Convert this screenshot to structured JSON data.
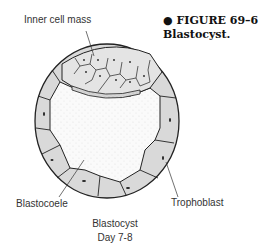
{
  "figure": {
    "bullet_icon": "filled-circle",
    "number": "FIGURE 69–6",
    "caption": "Blastocyst."
  },
  "labels": {
    "inner_cell_mass": "Inner cell mass",
    "blastocoele": "Blastocoele",
    "trophoblast": "Trophoblast",
    "title_line1": "Blastocyst",
    "title_line2": "Day 7-8"
  },
  "colors": {
    "outline": "#222222",
    "cell_fill": "#d9d9d9",
    "cavity_fill": "#f7f7f7"
  }
}
